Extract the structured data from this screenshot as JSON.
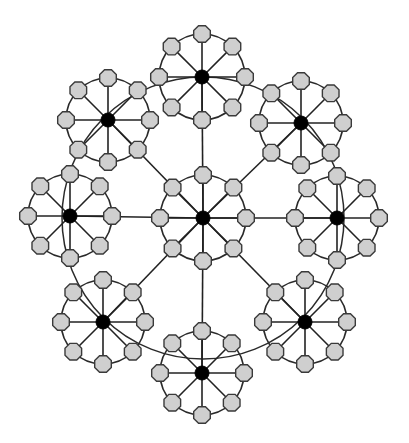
{
  "diagram": {
    "title": "",
    "colors": {
      "hub": "#000000",
      "leaf_fill": "#cfcfcf",
      "leaf_stroke": "#3a3a3a",
      "edge": "#222222"
    },
    "hub_radius": 7,
    "leaf_radius": 9,
    "spokes_per_cluster": 8,
    "center_cluster": {
      "id": "center",
      "cx": 203,
      "cy": 218,
      "r": 43
    },
    "outer_clusters": [
      {
        "id": "top",
        "cx": 202,
        "cy": 77,
        "r": 43
      },
      {
        "id": "top-right",
        "cx": 301,
        "cy": 123,
        "r": 42
      },
      {
        "id": "right",
        "cx": 337,
        "cy": 218,
        "r": 42
      },
      {
        "id": "bottom-right",
        "cx": 305,
        "cy": 322,
        "r": 42
      },
      {
        "id": "bottom",
        "cx": 202,
        "cy": 373,
        "r": 42
      },
      {
        "id": "bottom-left",
        "cx": 103,
        "cy": 322,
        "r": 42
      },
      {
        "id": "left",
        "cx": 70,
        "cy": 216,
        "r": 42
      },
      {
        "id": "top-left",
        "cx": 108,
        "cy": 120,
        "r": 42
      }
    ],
    "outer_ring": {
      "cx": 203,
      "cy": 218,
      "r": 141
    }
  }
}
